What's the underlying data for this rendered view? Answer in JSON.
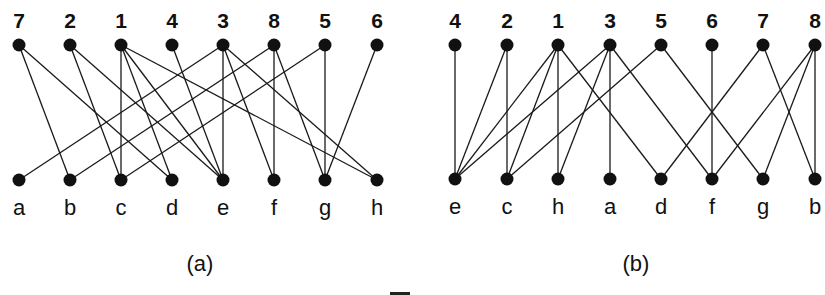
{
  "figure": {
    "colors": {
      "ink": "#111111",
      "background": "#ffffff"
    },
    "caption_fragment": "Fi",
    "panels": [
      {
        "id": "a",
        "label": "(a)",
        "label_x": 200,
        "top_y": 45,
        "bottom_y": 180,
        "top_nodes": [
          {
            "id": "7",
            "x": 19
          },
          {
            "id": "2",
            "x": 70
          },
          {
            "id": "1",
            "x": 121
          },
          {
            "id": "4",
            "x": 172
          },
          {
            "id": "3",
            "x": 223
          },
          {
            "id": "8",
            "x": 274
          },
          {
            "id": "5",
            "x": 325
          },
          {
            "id": "6",
            "x": 377
          }
        ],
        "bottom_nodes": [
          {
            "id": "a",
            "x": 19
          },
          {
            "id": "b",
            "x": 70
          },
          {
            "id": "c",
            "x": 121
          },
          {
            "id": "d",
            "x": 172
          },
          {
            "id": "e",
            "x": 223
          },
          {
            "id": "f",
            "x": 274
          },
          {
            "id": "g",
            "x": 325
          },
          {
            "id": "h",
            "x": 377
          }
        ],
        "edges": [
          [
            "7",
            "b"
          ],
          [
            "7",
            "d"
          ],
          [
            "2",
            "c"
          ],
          [
            "2",
            "e"
          ],
          [
            "1",
            "c"
          ],
          [
            "1",
            "d"
          ],
          [
            "1",
            "e"
          ],
          [
            "1",
            "h"
          ],
          [
            "4",
            "e"
          ],
          [
            "3",
            "a"
          ],
          [
            "3",
            "e"
          ],
          [
            "3",
            "f"
          ],
          [
            "3",
            "h"
          ],
          [
            "8",
            "b"
          ],
          [
            "8",
            "f"
          ],
          [
            "8",
            "g"
          ],
          [
            "5",
            "c"
          ],
          [
            "5",
            "g"
          ],
          [
            "6",
            "g"
          ]
        ]
      },
      {
        "id": "b",
        "label": "(b)",
        "label_x": 636,
        "top_y": 45,
        "bottom_y": 179,
        "top_nodes": [
          {
            "id": "4",
            "x": 455
          },
          {
            "id": "2",
            "x": 507
          },
          {
            "id": "1",
            "x": 558
          },
          {
            "id": "3",
            "x": 610
          },
          {
            "id": "5",
            "x": 661
          },
          {
            "id": "6",
            "x": 712
          },
          {
            "id": "7",
            "x": 763
          },
          {
            "id": "8",
            "x": 815
          }
        ],
        "bottom_nodes": [
          {
            "id": "e",
            "x": 455
          },
          {
            "id": "c",
            "x": 507
          },
          {
            "id": "h",
            "x": 558
          },
          {
            "id": "a",
            "x": 610
          },
          {
            "id": "d",
            "x": 661
          },
          {
            "id": "f",
            "x": 712
          },
          {
            "id": "g",
            "x": 763
          },
          {
            "id": "b",
            "x": 815
          }
        ],
        "edges": [
          [
            "4",
            "e"
          ],
          [
            "2",
            "e"
          ],
          [
            "2",
            "c"
          ],
          [
            "1",
            "e"
          ],
          [
            "1",
            "c"
          ],
          [
            "1",
            "h"
          ],
          [
            "1",
            "d"
          ],
          [
            "3",
            "e"
          ],
          [
            "3",
            "h"
          ],
          [
            "3",
            "a"
          ],
          [
            "3",
            "f"
          ],
          [
            "5",
            "c"
          ],
          [
            "5",
            "g"
          ],
          [
            "6",
            "f"
          ],
          [
            "7",
            "d"
          ],
          [
            "7",
            "b"
          ],
          [
            "8",
            "f"
          ],
          [
            "8",
            "g"
          ],
          [
            "8",
            "b"
          ]
        ]
      }
    ]
  }
}
